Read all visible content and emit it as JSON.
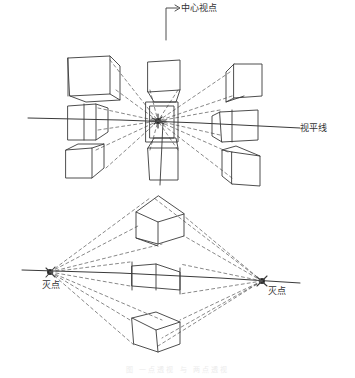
{
  "diagram": {
    "type": "hand-drawn perspective sketch",
    "colors": {
      "ink": "#3a3a3a",
      "background": "#ffffff"
    },
    "top": {
      "title": "one-point perspective",
      "center_label": "中心视点",
      "horizon_label": "视平线",
      "vanishing_point": [
        158,
        120
      ],
      "horizon_y": 122,
      "cubes": [
        {
          "name": "top-left",
          "front": [
            [
              68,
              58
            ],
            [
              110,
              58
            ],
            [
              110,
              95
            ],
            [
              68,
              95
            ]
          ]
        },
        {
          "name": "top-center",
          "front": [
            [
              148,
              62
            ],
            [
              180,
              62
            ],
            [
              180,
              95
            ],
            [
              148,
              95
            ]
          ]
        },
        {
          "name": "top-right",
          "front": [
            [
              236,
              65
            ],
            [
              260,
              65
            ],
            [
              260,
              98
            ],
            [
              236,
              98
            ]
          ]
        },
        {
          "name": "mid-left",
          "front": [
            [
              68,
              105
            ],
            [
              96,
              105
            ],
            [
              96,
              138
            ],
            [
              68,
              138
            ]
          ]
        },
        {
          "name": "mid-center",
          "front": [
            [
              148,
              102
            ],
            [
              178,
              102
            ],
            [
              178,
              140
            ],
            [
              148,
              140
            ]
          ]
        },
        {
          "name": "mid-right",
          "front": [
            [
              220,
              108
            ],
            [
              258,
              108
            ],
            [
              258,
              140
            ],
            [
              220,
              140
            ]
          ]
        },
        {
          "name": "bottom-left",
          "front": [
            [
              66,
              150
            ],
            [
              92,
              150
            ],
            [
              92,
              178
            ],
            [
              66,
              178
            ]
          ]
        },
        {
          "name": "bottom-center",
          "front": [
            [
              148,
              145
            ],
            [
              178,
              145
            ],
            [
              178,
              180
            ],
            [
              148,
              180
            ]
          ]
        },
        {
          "name": "bottom-right",
          "front": [
            [
              230,
              150
            ],
            [
              260,
              150
            ],
            [
              260,
              185
            ],
            [
              230,
              185
            ]
          ]
        }
      ]
    },
    "bottom": {
      "title": "two-point perspective",
      "left_vp_label": "灭点",
      "right_vp_label": "灭点",
      "left_vp": [
        50,
        272
      ],
      "right_vp": [
        262,
        282
      ],
      "horizon_y": 276
    },
    "caption": "图 一点透视 与 两点透视"
  }
}
